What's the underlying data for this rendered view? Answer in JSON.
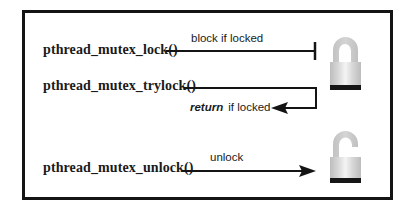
{
  "diagram": {
    "type": "mutex-operations",
    "border_color": "#141414",
    "padlock_colors": {
      "body_edge": "#c4c4c4",
      "body_center": "#f2f2f2",
      "shackle": "#c8c8c8",
      "base": "#161616"
    },
    "rows": [
      {
        "function": "pthread_mutex_lock()",
        "edge_label": "block if locked",
        "edge_style": "line-with-bar-terminator",
        "target": "locked-padlock"
      },
      {
        "function": "pthread_mutex_trylock()",
        "edge_label_emphasis": "return",
        "edge_label": "if locked",
        "edge_style": "line-returning-arrow",
        "target": "locked-padlock"
      },
      {
        "function": "pthread_mutex_unlock()",
        "edge_label": "unlock",
        "edge_style": "arrow",
        "target": "unlocked-padlock"
      }
    ],
    "padlocks": [
      {
        "state": "locked"
      },
      {
        "state": "unlocked"
      }
    ]
  }
}
